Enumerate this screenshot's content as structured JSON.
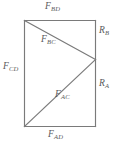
{
  "figure": {
    "type": "free-body-force-diagram",
    "stroke_color": "#7a7a7a",
    "text_color": "#5a5a5a",
    "background_color": "#ffffff",
    "geometry": {
      "rect": {
        "left": 24,
        "top": 20,
        "right": 95,
        "bottom": 126
      },
      "node_right": {
        "x": 95,
        "y": 59
      },
      "members": [
        {
          "name": "F_CD",
          "from": [
            24,
            20
          ],
          "to": [
            24,
            126
          ]
        },
        {
          "name": "F_BD",
          "from": [
            24,
            20
          ],
          "to": [
            95,
            20
          ]
        },
        {
          "name": "F_AD",
          "from": [
            24,
            126
          ],
          "to": [
            95,
            126
          ]
        },
        {
          "name": "R_B",
          "from": [
            95,
            20
          ],
          "to": [
            95,
            59
          ]
        },
        {
          "name": "R_A",
          "from": [
            95,
            59
          ],
          "to": [
            95,
            126
          ]
        },
        {
          "name": "F_BC",
          "from": [
            24,
            20
          ],
          "to": [
            95,
            59
          ]
        },
        {
          "name": "F_AC",
          "from": [
            24,
            126
          ],
          "to": [
            95,
            59
          ]
        }
      ]
    },
    "labels": {
      "f_bd": {
        "symbol": "F",
        "subscript": "BD"
      },
      "f_bc": {
        "symbol": "F",
        "subscript": "BC"
      },
      "f_cd": {
        "symbol": "F",
        "subscript": "CD"
      },
      "f_ac": {
        "symbol": "F",
        "subscript": "AC"
      },
      "f_ad": {
        "symbol": "F",
        "subscript": "AD"
      },
      "r_b": {
        "symbol": "R",
        "subscript": "B"
      },
      "r_a": {
        "symbol": "R",
        "subscript": "A"
      }
    }
  }
}
